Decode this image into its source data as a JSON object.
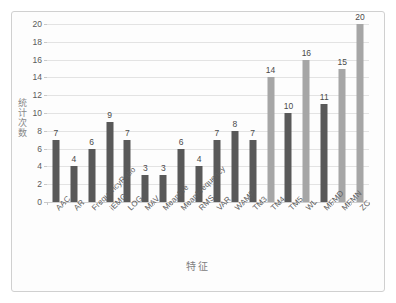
{
  "chart_data": {
    "type": "bar",
    "title": "",
    "xlabel": "特征",
    "ylabel": "统计次数",
    "ylim": [
      0,
      20
    ],
    "ytick_step": 2,
    "grid": true,
    "legend": "none",
    "categories": [
      "AAC",
      "AR",
      "FrequencyRatio",
      "iEMG",
      "LOG",
      "MAV",
      "MeanFre",
      "MeanFrequency",
      "RMS",
      "VAR",
      "WAMP",
      "TM3",
      "TM4",
      "TM5",
      "WL",
      "MFMD",
      "MFMN",
      "ZC"
    ],
    "values": [
      7,
      4,
      6,
      9,
      7,
      3,
      3,
      6,
      4,
      7,
      8,
      7,
      14,
      10,
      16,
      11,
      15,
      20
    ],
    "bar_colors": [
      "#595959",
      "#595959",
      "#595959",
      "#595959",
      "#595959",
      "#595959",
      "#595959",
      "#595959",
      "#595959",
      "#595959",
      "#595959",
      "#595959",
      "#a6a6a6",
      "#595959",
      "#a6a6a6",
      "#595959",
      "#a6a6a6",
      "#a6a6a6"
    ],
    "ytick_labels": [
      "0",
      "2",
      "4",
      "6",
      "8",
      "10",
      "12",
      "14",
      "16",
      "18",
      "20"
    ],
    "data_labels": [
      "7",
      "4",
      "6",
      "9",
      "7",
      "3",
      "3",
      "6",
      "4",
      "7",
      "8",
      "7",
      "14",
      "10",
      "16",
      "11",
      "15",
      "20"
    ],
    "colors": {
      "dark_bar": "#595959",
      "light_bar": "#a6a6a6",
      "gridline": "#e3e3e3",
      "axis_text": "#5a5a5a",
      "frame": "#d0d0d0",
      "background": "#ffffff"
    }
  }
}
